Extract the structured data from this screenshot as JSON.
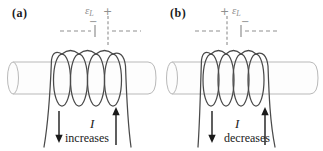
{
  "figure": {
    "colors": {
      "background": "#ffffff",
      "ink": "#1a1a1a",
      "coil": "#4a4a4a",
      "rod_outline": "#b9b9b9",
      "annotation_gray": "#8f8f8f"
    },
    "panels": [
      {
        "label": "(a)",
        "emf_symbol": "ε",
        "emf_subscript": "L",
        "plus_sign": "+",
        "minus_sign": "−",
        "polarity": "positive-right",
        "current_symbol": "I",
        "current_change": "increases"
      },
      {
        "label": "(b)",
        "emf_symbol": "ε",
        "emf_subscript": "L",
        "plus_sign": "+",
        "minus_sign": "−",
        "polarity": "positive-left",
        "current_symbol": "I",
        "current_change": "decreases"
      }
    ]
  }
}
